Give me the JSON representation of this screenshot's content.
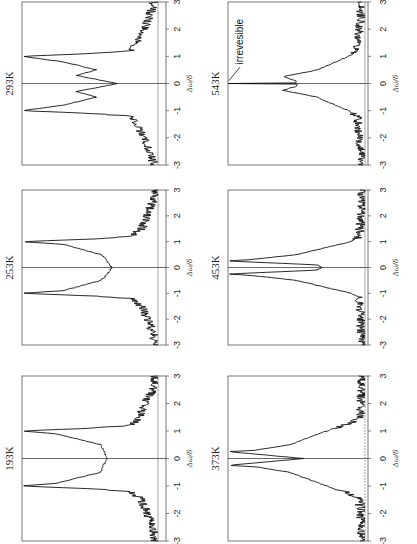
{
  "figure": {
    "orientation": "rotated 90 degrees counter-clockwise",
    "xlabel": "Δω/δ",
    "x_ticks": [
      "-3",
      "-2",
      "-1",
      "0",
      "1",
      "2",
      "3"
    ],
    "annotation": "irrevesible"
  },
  "chart_data": [
    {
      "type": "line",
      "title": "193K",
      "xlabel": "Δω/δ",
      "ylabel": "",
      "xlim": [
        -3,
        3
      ],
      "x": [
        -3,
        -2.5,
        -2,
        -1.5,
        -1.2,
        -1.1,
        -1.0,
        -0.9,
        -0.5,
        0,
        0.5,
        0.9,
        1.0,
        1.1,
        1.2,
        1.5,
        2,
        2.5,
        3
      ],
      "y": [
        0.02,
        0.04,
        0.08,
        0.12,
        0.2,
        0.5,
        1.0,
        0.75,
        0.42,
        0.38,
        0.42,
        0.75,
        1.0,
        0.5,
        0.2,
        0.14,
        0.1,
        0.04,
        0.02
      ]
    },
    {
      "type": "line",
      "title": "253K",
      "xlabel": "Δω/δ",
      "xlim": [
        -3,
        3
      ],
      "x": [
        -3,
        -2.5,
        -2,
        -1.5,
        -1.2,
        -1.1,
        -1.0,
        -0.9,
        -0.5,
        -0.3,
        0,
        0.3,
        0.5,
        0.9,
        1.0,
        1.1,
        1.2,
        1.5,
        2,
        2.5,
        3
      ],
      "y": [
        0.02,
        0.04,
        0.08,
        0.12,
        0.2,
        0.5,
        1.0,
        0.7,
        0.42,
        0.38,
        0.34,
        0.38,
        0.42,
        0.7,
        1.0,
        0.5,
        0.2,
        0.12,
        0.08,
        0.04,
        0.02
      ]
    },
    {
      "type": "line",
      "title": "293K",
      "xlabel": "Δω/δ",
      "xlim": [
        -3,
        3
      ],
      "x": [
        -3,
        -2.5,
        -2,
        -1.5,
        -1.2,
        -1.1,
        -1.0,
        -0.8,
        -0.5,
        -0.3,
        0,
        0.3,
        0.5,
        0.8,
        1.0,
        1.1,
        1.2,
        1.5,
        2,
        2.5,
        3
      ],
      "y": [
        0.03,
        0.06,
        0.1,
        0.16,
        0.2,
        0.5,
        1.0,
        0.7,
        0.45,
        0.6,
        0.3,
        0.6,
        0.45,
        0.7,
        1.0,
        0.5,
        0.2,
        0.16,
        0.1,
        0.06,
        0.03
      ]
    },
    {
      "type": "line",
      "title": "373K",
      "xlabel": "Δω/δ",
      "xlim": [
        -3,
        3
      ],
      "x": [
        -3,
        -2,
        -1.5,
        -1.3,
        -1,
        -0.5,
        -0.3,
        -0.25,
        0,
        0.25,
        0.3,
        0.5,
        1,
        1.3,
        1.5,
        2,
        3
      ],
      "y": [
        0.02,
        0.03,
        0.04,
        0.1,
        0.28,
        0.55,
        0.8,
        1.0,
        0.45,
        1.0,
        0.8,
        0.55,
        0.28,
        0.1,
        0.04,
        0.03,
        0.02
      ]
    },
    {
      "type": "line",
      "title": "453K",
      "xlabel": "Δω/δ",
      "xlim": [
        -3,
        3
      ],
      "x": [
        -3,
        -2,
        -1.2,
        -1,
        -0.5,
        -0.3,
        -0.25,
        -0.1,
        0,
        0.1,
        0.25,
        0.3,
        0.5,
        1,
        1.2,
        2,
        3
      ],
      "y": [
        0.02,
        0.03,
        0.04,
        0.1,
        0.5,
        0.85,
        1.0,
        0.35,
        0.32,
        0.35,
        1.0,
        0.85,
        0.5,
        0.1,
        0.04,
        0.03,
        0.02
      ]
    },
    {
      "type": "line",
      "title": "543K",
      "xlabel": "Δω/δ",
      "xlim": [
        -3,
        3
      ],
      "annotation": "irrevesible",
      "x": [
        -3,
        -2,
        -1.2,
        -1,
        -0.5,
        -0.3,
        -0.25,
        -0.1,
        -0.02,
        0,
        0.02,
        0.1,
        0.25,
        0.3,
        0.5,
        1,
        1.2,
        2,
        3
      ],
      "y": [
        0.02,
        0.04,
        0.06,
        0.12,
        0.35,
        0.55,
        0.6,
        0.5,
        0.5,
        1.0,
        0.5,
        0.5,
        0.6,
        0.55,
        0.35,
        0.12,
        0.06,
        0.04,
        0.02
      ]
    }
  ],
  "panels": [
    {
      "title": "293K"
    },
    {
      "title": "543K"
    },
    {
      "title": "253K"
    },
    {
      "title": "453K"
    },
    {
      "title": "193K"
    },
    {
      "title": "373K"
    }
  ]
}
